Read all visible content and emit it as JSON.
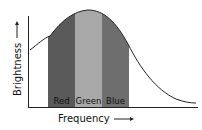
{
  "diagram": {
    "type": "spectrum-curve",
    "x_axis_label": "Frequency",
    "y_axis_label": "Brightness",
    "bands": [
      {
        "label": "Red",
        "color": "#5a5a5a"
      },
      {
        "label": "Green",
        "color": "#a8a8a8"
      },
      {
        "label": "Blue",
        "color": "#6e6e6e"
      }
    ],
    "colors": {
      "axis": "#222222",
      "curve": "#222222",
      "background": "#ffffff"
    }
  }
}
